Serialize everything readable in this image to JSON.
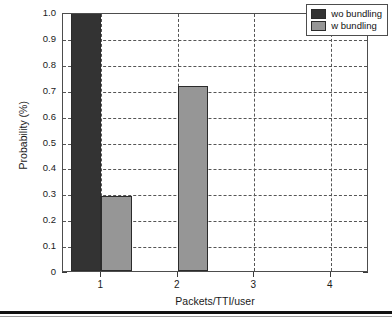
{
  "chart_data": {
    "type": "bar",
    "title": "",
    "xlabel": "Packets/TTI/user",
    "ylabel": "Probability (%)",
    "categories": [
      "1",
      "2",
      "3",
      "4"
    ],
    "x": [
      1,
      2,
      3,
      4
    ],
    "xlim": [
      0.5,
      4.5
    ],
    "ylim": [
      0,
      1.0
    ],
    "ytick_labels": [
      "0",
      "0.1",
      "0.2",
      "0.3",
      "0.4",
      "0.5",
      "0.6",
      "0.7",
      "0.8",
      "0.9",
      "1.0"
    ],
    "ytick_values": [
      0,
      0.1,
      0.2,
      0.3,
      0.4,
      0.5,
      0.6,
      0.7,
      0.8,
      0.9,
      1.0
    ],
    "xtick_labels": [
      "1",
      "2",
      "3",
      "4"
    ],
    "grid": true,
    "grid_style": "dashed",
    "legend_position": "top-right",
    "series": [
      {
        "name": "wo bundling",
        "color": "#333333",
        "values": [
          1.0,
          0,
          0,
          0
        ]
      },
      {
        "name": "w bundling",
        "color": "#969696",
        "values": [
          0.29,
          0.715,
          0,
          0
        ]
      }
    ]
  },
  "legend": {
    "items": [
      {
        "label": "wo bundling",
        "color": "#333333"
      },
      {
        "label": "w bundling",
        "color": "#969696"
      }
    ]
  },
  "axes": {
    "y_title": "Probability (%)",
    "x_title": "Packets/TTI/user",
    "y_ticks": [
      "1.0",
      "0.9",
      "0.8",
      "0.7",
      "0.6",
      "0.5",
      "0.4",
      "0.3",
      "0.2",
      "0.1",
      "0"
    ],
    "x_ticks": [
      "1",
      "2",
      "3",
      "4"
    ]
  },
  "colors": {
    "series_dark": "#333333",
    "series_light": "#969696",
    "grid": "#555555",
    "axis": "#4d4d4d",
    "text": "#1a1a1a",
    "background": "#ffffff"
  }
}
